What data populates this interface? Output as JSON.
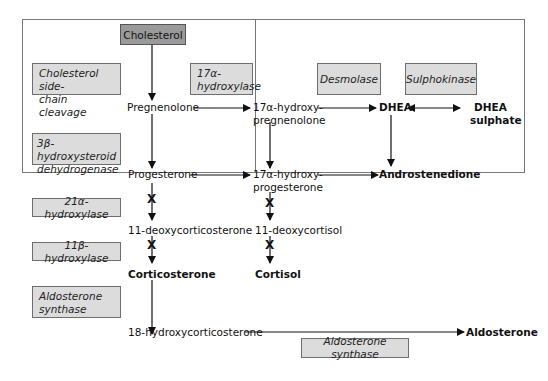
{
  "diagram": {
    "title_node": "Cholesterol",
    "enzymes": {
      "scc": "Cholesterol side-chain cleavage",
      "scc_line1": "Cholesterol side-",
      "scc_line2": "chain cleavage",
      "hydroxylase17_line1": "17α-",
      "hydroxylase17_line2": "hydroxylase",
      "desmolase": "Desmolase",
      "sulphokinase": "Sulphokinase",
      "hsd3b_line1": "3β-hydroxysteroid",
      "hsd3b_line2": "dehydrogenase",
      "hydroxylase21": "21α-hydroxylase",
      "hydroxylase11": "11β-hydroxylase",
      "aldo_synth_line1": "Aldosterone",
      "aldo_synth_line2": "synthase",
      "aldo_synth_bottom": "Aldosterone synthase"
    },
    "metabolites": {
      "pregnenolone": "Pregnenolone",
      "ohpreg_line1": "17α-hydroxy-",
      "ohpreg_line2": "pregnenolone",
      "dhea": "DHEA",
      "dheas_line1": "DHEA",
      "dheas_line2": "sulphate",
      "progesterone": "Progesterone",
      "ohprog_line1": "17α-hydroxy-",
      "ohprog_line2": "progesterone",
      "androstenedione": "Androstenedione",
      "doc": "11-deoxycorticosterone",
      "deoxycortisol": "11-deoxycortisol",
      "corticosterone": "Corticosterone",
      "cortisol": "Cortisol",
      "ohcorticosterone": "18-hydroxycorticosterone",
      "aldosterone": "Aldosterone"
    },
    "blocked_marker": "X",
    "colors": {
      "enzyme_box_fill": "#dcdcdc",
      "cholesterol_box_fill": "#9a9a9a",
      "border": "#6e6e6e",
      "arrow": "#111111"
    }
  }
}
